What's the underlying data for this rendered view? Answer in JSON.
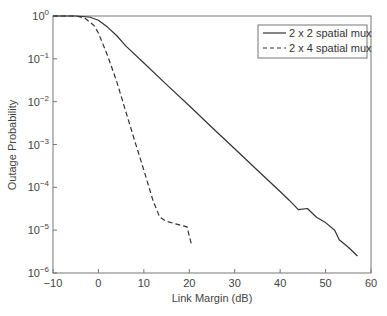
{
  "chart_data": {
    "type": "line",
    "title": "",
    "xlabel": "Link Margin (dB)",
    "ylabel": "Outage Probability",
    "xlim": [
      -10,
      60
    ],
    "ylim": [
      1e-06,
      1
    ],
    "yscale": "log",
    "grid": false,
    "legend_position": "upper right",
    "x_ticks": [
      "−10",
      "0",
      "10",
      "20",
      "30",
      "40",
      "50",
      "60"
    ],
    "y_ticks": [
      {
        "base": "10",
        "exp": "0"
      },
      {
        "base": "10",
        "exp": "−1"
      },
      {
        "base": "10",
        "exp": "−2"
      },
      {
        "base": "10",
        "exp": "−3"
      },
      {
        "base": "10",
        "exp": "−4"
      },
      {
        "base": "10",
        "exp": "−5"
      },
      {
        "base": "10",
        "exp": "−6"
      }
    ],
    "series": [
      {
        "name": "2 x 2 spatial mux",
        "style": "solid",
        "x": [
          -10,
          -5,
          -2,
          0,
          2,
          4,
          6,
          10,
          15,
          20,
          25,
          30,
          35,
          40,
          42,
          44,
          46,
          48,
          50,
          52,
          53,
          55,
          57
        ],
        "y": [
          1.0,
          1.0,
          0.95,
          0.8,
          0.55,
          0.35,
          0.2,
          0.08,
          0.025,
          0.008,
          0.0025,
          0.0008,
          0.00025,
          8e-05,
          5e-05,
          3e-05,
          3.2e-05,
          2e-05,
          1.5e-05,
          1e-05,
          6e-06,
          4e-06,
          2.5e-06
        ]
      },
      {
        "name": "2 x 4 spatial mux",
        "style": "dashed",
        "x": [
          -10,
          -5,
          -3,
          -1,
          0,
          2,
          4,
          6,
          8,
          10,
          12,
          13.5,
          15,
          17,
          19.5,
          20.5
        ],
        "y": [
          1.0,
          1.0,
          0.9,
          0.6,
          0.4,
          0.12,
          0.03,
          0.006,
          0.0012,
          0.00025,
          5e-05,
          2e-05,
          1.6e-05,
          1.4e-05,
          1.2e-05,
          4.5e-06
        ]
      }
    ]
  }
}
